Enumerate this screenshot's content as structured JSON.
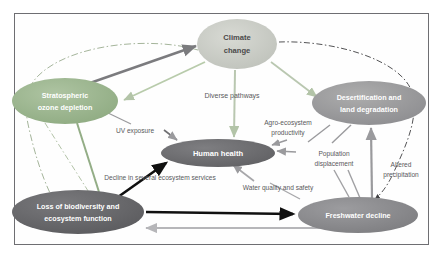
{
  "figure": {
    "type": "concept-map",
    "title": "",
    "background_color": "#fefefe",
    "border_color": "#6e6e72"
  },
  "nodes": [
    {
      "id": "climate-change",
      "label_line1": "Climate",
      "label_line2": "change",
      "cx": 237,
      "cy": 44,
      "rx": 40,
      "ry": 25,
      "fill": "#c9cbc6",
      "text_color": "#4a4a4a",
      "font_size": 7.6
    },
    {
      "id": "stratospheric-ozone-depletion",
      "label_line1": "Stratospheric",
      "label_line2": "ozone depletion",
      "cx": 65,
      "cy": 101,
      "rx": 53,
      "ry": 23,
      "fill": "#9bb58e",
      "text_color": "#ffffff",
      "font_size": 7.2
    },
    {
      "id": "desertification-and-land-degradation",
      "label_line1": "Desertification and",
      "label_line2": "land degradation",
      "cx": 369,
      "cy": 103,
      "rx": 57,
      "ry": 22,
      "fill": "#9a9a9a",
      "text_color": "#ffffff",
      "font_size": 7.2
    },
    {
      "id": "human-health",
      "label_line1": "Human health",
      "label_line2": "",
      "cx": 218,
      "cy": 153,
      "rx": 57,
      "ry": 14,
      "fill": "#6f6f72",
      "text_color": "#ffffff",
      "font_size": 7.6
    },
    {
      "id": "loss-of-biodiversity-and-ecosystem-function",
      "label_line1": "Loss of biodiversity and",
      "label_line2": "ecosystem function",
      "cx": 78,
      "cy": 212,
      "rx": 66,
      "ry": 22,
      "fill": "#6a6a6d",
      "text_color": "#ffffff",
      "font_size": 7.2
    },
    {
      "id": "freshwater-decline",
      "label_line1": "Freshwater decline",
      "label_line2": "",
      "cx": 358,
      "cy": 215,
      "rx": 60,
      "ry": 18,
      "fill": "#8c8c8f",
      "text_color": "#ffffff",
      "font_size": 7.2
    }
  ],
  "edge_labels": [
    {
      "id": "diverse-pathways",
      "text": "Diverse pathways",
      "x": 232,
      "y": 96,
      "font_size": 7.0
    },
    {
      "id": "uv-exposure",
      "text": "UV exposure",
      "x": 135,
      "y": 131,
      "font_size": 6.6
    },
    {
      "id": "agro-ecosystem-productivity-l1",
      "text": "Agro-ecosystem",
      "x": 288,
      "y": 123,
      "font_size": 6.6
    },
    {
      "id": "agro-ecosystem-productivity-l2",
      "text": "productivity",
      "x": 288,
      "y": 133,
      "font_size": 6.6
    },
    {
      "id": "population-displacement-l1",
      "text": "Population",
      "x": 334,
      "y": 154,
      "font_size": 6.6
    },
    {
      "id": "population-displacement-l2",
      "text": "displacement",
      "x": 334,
      "y": 164,
      "font_size": 6.6
    },
    {
      "id": "altered-precipitation-l1",
      "text": "Altered",
      "x": 401,
      "y": 165,
      "font_size": 6.6
    },
    {
      "id": "altered-precipitation-l2",
      "text": "precipitation",
      "x": 401,
      "y": 175,
      "font_size": 6.6
    },
    {
      "id": "decline-in-several-ecosystem-services",
      "text": "Decline in several ecosystem services",
      "x": 160,
      "y": 178,
      "font_size": 6.6
    },
    {
      "id": "water-quality-and-safety",
      "text": "Water quality and safety",
      "x": 278,
      "y": 188,
      "font_size": 6.6
    }
  ],
  "edges": [
    {
      "id": "ozone-to-climate",
      "style": "solid",
      "color": "#7b7b7e",
      "width": 2.4,
      "arrow": "end"
    },
    {
      "id": "climate-to-ozone",
      "style": "solid",
      "color": "#b8cbab",
      "width": 1.8,
      "arrow": "end"
    },
    {
      "id": "climate-to-human-health",
      "style": "solid",
      "color": "#b9c7b0",
      "width": 2.0,
      "arrow": "end"
    },
    {
      "id": "climate-to-desertification",
      "style": "solid",
      "color": "#b9c7b0",
      "width": 1.8,
      "arrow": "end"
    },
    {
      "id": "climate-to-biodiversity-arc",
      "style": "dash-dot",
      "color": "#9aab8f",
      "width": 0.9,
      "arrow": "none"
    },
    {
      "id": "climate-to-freshwater-arc",
      "style": "dash-dot",
      "color": "#3f3f42",
      "width": 0.9,
      "arrow": "end"
    },
    {
      "id": "ozone-to-biodiversity",
      "style": "solid",
      "color": "#93ad86",
      "width": 2.0,
      "arrow": "none"
    },
    {
      "id": "ozone-to-biodiversity-dashed",
      "style": "dash-dot",
      "color": "#a9bb9d",
      "width": 0.9,
      "arrow": "none"
    },
    {
      "id": "ozone-to-uv-exposure",
      "style": "solid",
      "color": "#9a9a9d",
      "width": 1.2,
      "arrow": "none"
    },
    {
      "id": "uv-exposure-to-human-health",
      "style": "solid",
      "color": "#6f6f72",
      "width": 1.6,
      "arrow": "end"
    },
    {
      "id": "biodiversity-to-human-health",
      "style": "solid",
      "color": "#101010",
      "width": 2.6,
      "arrow": "end"
    },
    {
      "id": "biodiversity-to-freshwater",
      "style": "solid",
      "color": "#101010",
      "width": 2.6,
      "arrow": "end"
    },
    {
      "id": "freshwater-to-biodiversity",
      "style": "solid",
      "color": "#b6b6b9",
      "width": 2.0,
      "arrow": "end"
    },
    {
      "id": "freshwater-to-human-health",
      "style": "solid",
      "color": "#a7a7aa",
      "width": 1.6,
      "arrow": "end"
    },
    {
      "id": "desertification-to-human-health",
      "style": "solid",
      "color": "#9a9a9d",
      "width": 1.6,
      "arrow": "end"
    },
    {
      "id": "desertification-to-freshwater",
      "style": "solid",
      "color": "#9a9a9d",
      "width": 1.4,
      "arrow": "none"
    },
    {
      "id": "freshwater-to-desertification",
      "style": "solid",
      "color": "#9a9a9d",
      "width": 2.2,
      "arrow": "end"
    },
    {
      "id": "agro-to-human-health",
      "style": "solid",
      "color": "#9a9a9d",
      "width": 1.6,
      "arrow": "end"
    },
    {
      "id": "population-displacement-link",
      "style": "solid",
      "color": "#a0a0a3",
      "width": 1.4,
      "arrow": "none"
    }
  ]
}
